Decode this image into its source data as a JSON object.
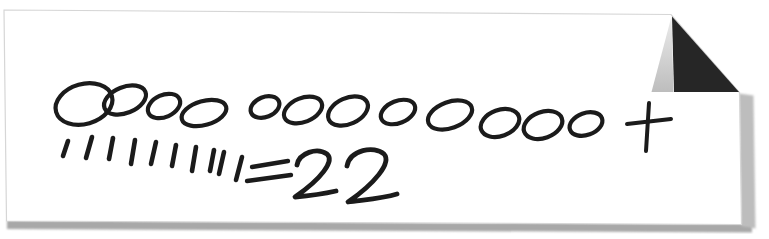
{
  "canvas": {
    "width": 769,
    "height": 239,
    "background": "#ffffff"
  },
  "note": {
    "reading": "Hand-drawn counting note: 12 circles plus 10 tally marks equals 22",
    "circle_count": 12,
    "tally_count": 10,
    "plus_label": "+",
    "equals_label": "=",
    "total_label": "22"
  },
  "paper": {
    "fill": "#ffffff",
    "edge_color": "#d6d6d6",
    "outline_points": "4,10 671,14.5 739.5,92.5 741.5,224.5 6.5,221",
    "fold": {
      "dark_fill": "#262626",
      "dark_triangle_points": "672,16.5 739,92 674,92",
      "light_fill_top": "#ececec",
      "light_fill_bottom": "#bdbdbd",
      "light_triangle_points": "671.5,16.5 673.5,92 651.5,92"
    },
    "shadow": {
      "bottom_color": "#a8a8a8",
      "bottom_points": "7,220.5 752,224 752,232.5 7,229",
      "right_color": "#bdbdbd",
      "right_points": "739,93.5 753.5,95.5 755.5,228.5 741,226"
    }
  },
  "drawing": {
    "ink_color": "#1b1b1b",
    "oval_stroke_width": 4.2,
    "tick_stroke_width": 4.6,
    "equals_stroke_width": 4.4,
    "plus_stroke_width": 4.0,
    "digit_stroke_width": 4.8,
    "ovals": [
      {
        "cx": 84,
        "cy": 104,
        "rx": 29,
        "ry": 20,
        "rot": -16
      },
      {
        "cx": 125,
        "cy": 100,
        "rx": 22,
        "ry": 13,
        "rot": -22
      },
      {
        "cx": 164,
        "cy": 106,
        "rx": 17,
        "ry": 11,
        "rot": -24
      },
      {
        "cx": 204,
        "cy": 113,
        "rx": 23,
        "ry": 12,
        "rot": -16
      },
      {
        "cx": 265,
        "cy": 107,
        "rx": 15,
        "ry": 10,
        "rot": -22
      },
      {
        "cx": 303,
        "cy": 110,
        "rx": 20,
        "ry": 12,
        "rot": -22
      },
      {
        "cx": 348,
        "cy": 111,
        "rx": 21,
        "ry": 13,
        "rot": -24
      },
      {
        "cx": 398,
        "cy": 112,
        "rx": 18,
        "ry": 11,
        "rot": -22
      },
      {
        "cx": 450,
        "cy": 115,
        "rx": 23,
        "ry": 13,
        "rot": -20
      },
      {
        "cx": 500,
        "cy": 123,
        "rx": 20,
        "ry": 13,
        "rot": -20
      },
      {
        "cx": 543,
        "cy": 125,
        "rx": 20,
        "ry": 13,
        "rot": -20
      },
      {
        "cx": 586,
        "cy": 124,
        "rx": 17,
        "ry": 11,
        "rot": -20
      }
    ],
    "ticks": [
      [
        68,
        141,
        63,
        156
      ],
      [
        92,
        137,
        86,
        158
      ],
      [
        113,
        138,
        109,
        159
      ],
      [
        135,
        140,
        131,
        164
      ],
      [
        156,
        142,
        151,
        164
      ],
      [
        176,
        145,
        172,
        166
      ],
      [
        196,
        147,
        192,
        171
      ],
      [
        214,
        150,
        210,
        171
      ],
      [
        224,
        152,
        219,
        174
      ],
      [
        242,
        157,
        236,
        180
      ]
    ],
    "plus": {
      "vertical": [
        649,
        103,
        646,
        151
      ],
      "horizontal": [
        627,
        124,
        671,
        119
      ]
    },
    "equals": [
      [
        252,
        167,
        288,
        161
      ],
      [
        247,
        181,
        291,
        175
      ]
    ],
    "digit_paths": [
      "M297,165 C299,153 317,147 327,154 C335,161 321,179 295,197 C307,196 323,194 336,191",
      "M347,166 C350,150 374,145 384,154 C392,163 374,184 348,202 C360,200 381,199 397,194"
    ]
  }
}
